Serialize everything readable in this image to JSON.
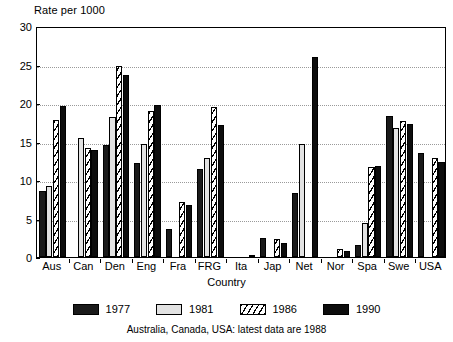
{
  "chart_data": {
    "type": "bar",
    "title": "",
    "ylabel": "Rate per 1000",
    "xlabel": "Country",
    "ylim": [
      0,
      30
    ],
    "yticks": [
      0,
      5,
      10,
      15,
      20,
      25,
      30
    ],
    "grid": true,
    "legend_position": "bottom",
    "footnote": "Australia, Canada, USA: latest data are 1988",
    "categories": [
      "Aus",
      "Can",
      "Den",
      "Eng",
      "Fra",
      "FRG",
      "Ita",
      "Jap",
      "Net",
      "Nor",
      "Spa",
      "Swe",
      "USA"
    ],
    "series": [
      {
        "name": "1977",
        "fill": "solid-black",
        "color": "#1a1a1a",
        "values": [
          8.6,
          null,
          14.6,
          12.2,
          3.7,
          11.4,
          null,
          2.5,
          8.3,
          null,
          1.6,
          18.3,
          13.5
        ]
      },
      {
        "name": "1981",
        "fill": "light-grey",
        "color": "#e2e2e2",
        "values": [
          9.2,
          15.4,
          18.2,
          14.7,
          null,
          12.8,
          null,
          null,
          14.7,
          null,
          4.4,
          16.8,
          null
        ]
      },
      {
        "name": "1986",
        "fill": "diagonal-hatch",
        "color": "#ffffff",
        "values": [
          17.8,
          14.2,
          24.8,
          19.0,
          7.2,
          19.5,
          null,
          2.3,
          null,
          1.0,
          11.7,
          17.6,
          12.8
        ]
      },
      {
        "name": "1990",
        "fill": "solid-black",
        "color": "#0d0d0d",
        "values": [
          19.6,
          13.9,
          23.6,
          19.8,
          6.8,
          17.2,
          0.3,
          1.8,
          26.0,
          0.8,
          11.8,
          17.3,
          12.4
        ]
      }
    ]
  },
  "legend": {
    "items": [
      {
        "label": "1977"
      },
      {
        "label": "1981"
      },
      {
        "label": "1986"
      },
      {
        "label": "1990"
      }
    ]
  }
}
